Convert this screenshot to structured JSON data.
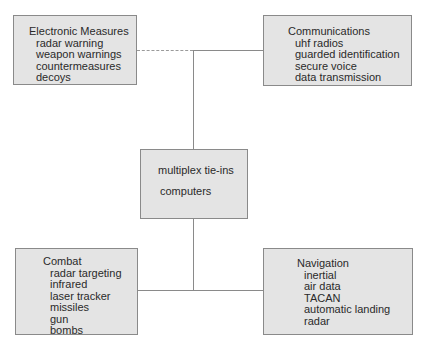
{
  "diagram": {
    "colors": {
      "box_fill": "#e4e4e4",
      "box_border": "#8a8a8a",
      "line": "#8a8a8a",
      "text": "#2a2a2a"
    },
    "nodes": {
      "electronic_measures": {
        "title": "Electronic Measures",
        "items": [
          "radar warning",
          "weapon warnings",
          "countermeasures",
          "decoys"
        ]
      },
      "communications": {
        "title": "Communications",
        "items": [
          "uhf radios",
          "guarded identification",
          "secure voice",
          "data transmission"
        ]
      },
      "center": {
        "line1": "multiplex tie-ins",
        "line2": "computers"
      },
      "combat": {
        "title": "Combat",
        "items": [
          "radar targeting",
          "infrared",
          "laser tracker",
          "missiles",
          "gun",
          "bombs"
        ]
      },
      "navigation": {
        "title": "Navigation",
        "items": [
          "inertial",
          "air data",
          "TACAN",
          "automatic landing",
          "radar"
        ]
      }
    },
    "edges": [
      {
        "from": "electronic_measures",
        "to": "center",
        "style": "dashed-then-solid"
      },
      {
        "from": "communications",
        "to": "center",
        "style": "solid"
      },
      {
        "from": "combat",
        "to": "center",
        "style": "solid"
      },
      {
        "from": "navigation",
        "to": "center",
        "style": "solid"
      }
    ]
  }
}
